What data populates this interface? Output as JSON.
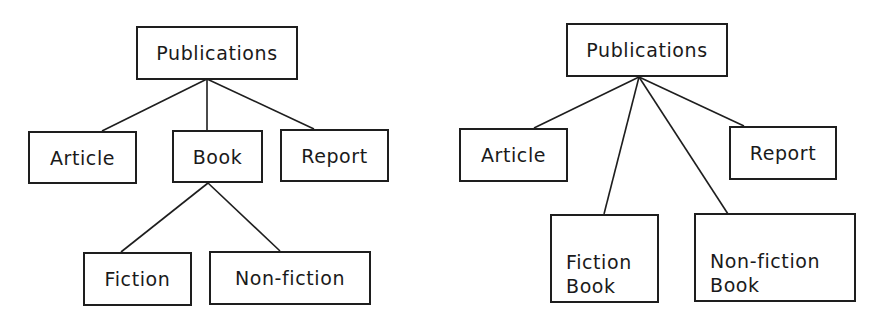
{
  "diagrams": [
    {
      "name": "hierarchy-with-book",
      "nodes": {
        "publications": {
          "label": "Publications",
          "x": 136,
          "y": 26,
          "w": 162,
          "h": 54
        },
        "article": {
          "label": "Article",
          "x": 28,
          "y": 131,
          "w": 109,
          "h": 53
        },
        "book": {
          "label": "Book",
          "x": 172,
          "y": 130,
          "w": 91,
          "h": 53
        },
        "report": {
          "label": "Report",
          "x": 280,
          "y": 129,
          "w": 109,
          "h": 53
        },
        "fiction": {
          "label": "Fiction",
          "x": 83,
          "y": 252,
          "w": 109,
          "h": 54
        },
        "nonfiction": {
          "label": "Non-fiction",
          "x": 209,
          "y": 251,
          "w": 162,
          "h": 54
        }
      },
      "edges": [
        {
          "from": "publications",
          "to": "article",
          "x1": 207,
          "y1": 79,
          "x2": 102,
          "y2": 131
        },
        {
          "from": "publications",
          "to": "book",
          "x1": 207,
          "y1": 79,
          "x2": 207,
          "y2": 130
        },
        {
          "from": "publications",
          "to": "report",
          "x1": 207,
          "y1": 79,
          "x2": 314,
          "y2": 129
        },
        {
          "from": "book",
          "to": "fiction",
          "x1": 208,
          "y1": 183,
          "x2": 121,
          "y2": 252
        },
        {
          "from": "book",
          "to": "nonfiction",
          "x1": 208,
          "y1": 183,
          "x2": 280,
          "y2": 251
        }
      ]
    },
    {
      "name": "hierarchy-flattened",
      "nodes": {
        "publications": {
          "label": "Publications",
          "x": 566,
          "y": 23,
          "w": 162,
          "h": 54
        },
        "article": {
          "label": "Article",
          "x": 459,
          "y": 128,
          "w": 109,
          "h": 54
        },
        "report": {
          "label": "Report",
          "x": 729,
          "y": 126,
          "w": 108,
          "h": 54
        },
        "fiction_book": {
          "label": "Fiction\nBook",
          "x": 550,
          "y": 214,
          "w": 109,
          "h": 89
        },
        "nonfiction_book": {
          "label": "Non-fiction\nBook",
          "x": 694,
          "y": 213,
          "w": 162,
          "h": 89
        }
      },
      "edges": [
        {
          "from": "publications",
          "to": "article",
          "x1": 639,
          "y1": 77,
          "x2": 534,
          "y2": 128
        },
        {
          "from": "publications",
          "to": "fiction_book",
          "x1": 639,
          "y1": 77,
          "x2": 604,
          "y2": 214
        },
        {
          "from": "publications",
          "to": "nonfiction_book",
          "x1": 639,
          "y1": 77,
          "x2": 728,
          "y2": 214
        },
        {
          "from": "publications",
          "to": "report",
          "x1": 639,
          "y1": 77,
          "x2": 744,
          "y2": 126
        }
      ]
    }
  ],
  "colors": {
    "stroke": "#1e1e1e",
    "text": "#1a1a1a",
    "background": "#ffffff"
  }
}
